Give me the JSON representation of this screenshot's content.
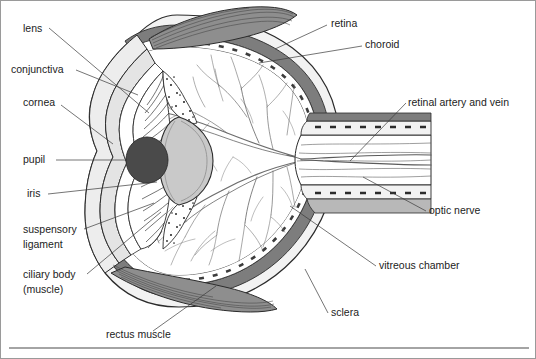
{
  "figure": {
    "type": "anatomical-diagram",
    "background_color": "#ffffff",
    "ink_color": "#2b2b2b",
    "leader_color": "#3a3a3a",
    "frame": {
      "border_color": "#9a9a9a",
      "bottom_rule": true,
      "bottom_rule_color": "#4a4a4a"
    },
    "palette": {
      "sclera": "#f2f2f2",
      "choroid": "#7d7d7d",
      "retina_band": "#ffffff",
      "vitreous": "#ffffff",
      "lens": "#c9c9c9",
      "pupil": "#4a4a4a",
      "iris": "#ffffff",
      "cornea": "#e4e4e4",
      "conjunctiva": "#ededed",
      "muscle": "#8e8e8e",
      "optic_nerve": "#b8b8b8",
      "ciliary_body": "#ffffff"
    }
  },
  "labels": [
    {
      "id": "lens",
      "text": "lens",
      "x": 22,
      "y": 31,
      "anchor": "start",
      "side": "left"
    },
    {
      "id": "conjunctiva",
      "text": "conjunctiva",
      "x": 10,
      "y": 72,
      "anchor": "start",
      "side": "left"
    },
    {
      "id": "cornea",
      "text": "cornea",
      "x": 22,
      "y": 105,
      "anchor": "start",
      "side": "left"
    },
    {
      "id": "pupil",
      "text": "pupil",
      "x": 22,
      "y": 162,
      "anchor": "start",
      "side": "left"
    },
    {
      "id": "iris",
      "text": "iris",
      "x": 26,
      "y": 196,
      "anchor": "start",
      "side": "left"
    },
    {
      "id": "suspensory",
      "text": "suspensory",
      "x": 22,
      "y": 232,
      "anchor": "start",
      "side": "left"
    },
    {
      "id": "ligament",
      "text": "ligament",
      "x": 22,
      "y": 247,
      "anchor": "start",
      "side": "left"
    },
    {
      "id": "ciliary",
      "text": "ciliary body",
      "x": 22,
      "y": 277,
      "anchor": "start",
      "side": "left"
    },
    {
      "id": "muscle_par",
      "text": "(muscle)",
      "x": 22,
      "y": 292,
      "anchor": "start",
      "side": "left"
    },
    {
      "id": "rectus",
      "text": "rectus muscle",
      "x": 105,
      "y": 337,
      "anchor": "start",
      "side": "bottom"
    },
    {
      "id": "retina",
      "text": "retina",
      "x": 330,
      "y": 26,
      "anchor": "start",
      "side": "right"
    },
    {
      "id": "choroid",
      "text": "choroid",
      "x": 364,
      "y": 47,
      "anchor": "start",
      "side": "right"
    },
    {
      "id": "artery_vein",
      "text": "retinal artery and vein",
      "x": 407,
      "y": 105,
      "anchor": "start",
      "side": "right"
    },
    {
      "id": "optic_nerve",
      "text": "optic nerve",
      "x": 428,
      "y": 213,
      "anchor": "start",
      "side": "right"
    },
    {
      "id": "vitreous",
      "text": "vitreous chamber",
      "x": 378,
      "y": 268,
      "anchor": "start",
      "side": "right"
    },
    {
      "id": "sclera",
      "text": "sclera",
      "x": 330,
      "y": 315,
      "anchor": "start",
      "side": "right"
    }
  ],
  "leader_lines": [
    {
      "id": "lead-lens",
      "points": "48,27 148,112"
    },
    {
      "id": "lead-conjunctiva",
      "points": "75,69 137,94"
    },
    {
      "id": "lead-cornea",
      "points": "60,104 112,143"
    },
    {
      "id": "lead-pupil",
      "points": "55,159 126,159"
    },
    {
      "id": "lead-iris",
      "points": "47,193 156,181"
    },
    {
      "id": "lead-suspensory",
      "points": "83,228 153,202"
    },
    {
      "id": "lead-ciliary",
      "points": "86,273 160,211"
    },
    {
      "id": "lead-rectus",
      "points": "152,330 215,285"
    },
    {
      "id": "lead-retina",
      "points": "326,24 274,48"
    },
    {
      "id": "lead-choroid",
      "points": "361,45 258,62"
    },
    {
      "id": "lead-artery",
      "points": "405,102 349,160"
    },
    {
      "id": "lead-optic",
      "points": "425,210 362,176"
    },
    {
      "id": "lead-vitreous",
      "points": "375,265 289,205"
    },
    {
      "id": "lead-sclera",
      "points": "327,312 304,268"
    }
  ],
  "structures": [
    {
      "id": "sclera",
      "name": "sclera",
      "description": "outer white fibrous coat of the eyeball"
    },
    {
      "id": "choroid",
      "name": "choroid",
      "description": "dark vascular middle layer"
    },
    {
      "id": "retina",
      "name": "retina",
      "description": "inner photoreceptor layer shown as dashed band"
    },
    {
      "id": "vitreous",
      "name": "vitreous chamber",
      "description": "large interior cavity filled with vitreous humour, crossed by retinal vessels"
    },
    {
      "id": "lens",
      "name": "lens",
      "description": "biconvex grey lenticular body behind the pupil"
    },
    {
      "id": "pupil",
      "name": "pupil",
      "description": "dark central aperture"
    },
    {
      "id": "iris",
      "name": "iris",
      "description": "radially striated ring surrounding the pupil"
    },
    {
      "id": "cornea",
      "name": "cornea",
      "description": "transparent anterior dome"
    },
    {
      "id": "conjunctiva",
      "name": "conjunctiva",
      "description": "thin membrane over the anterior sclera"
    },
    {
      "id": "ciliary_body",
      "name": "ciliary body (muscle)",
      "description": "stippled wedge at lens equator"
    },
    {
      "id": "suspensory",
      "name": "suspensory ligament",
      "description": "fibres tethering the lens to the ciliary body"
    },
    {
      "id": "optic_nerve",
      "name": "optic nerve",
      "description": "nerve bundle leaving posterior pole toward the right"
    },
    {
      "id": "artery_vein",
      "name": "retinal artery and vein",
      "description": "vessels entering along the optic nerve"
    },
    {
      "id": "rectus_muscle",
      "name": "rectus muscle",
      "description": "striated extraocular muscles above and below the globe"
    }
  ]
}
